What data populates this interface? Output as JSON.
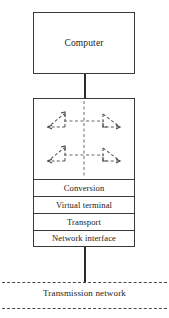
{
  "diagram": {
    "computer": {
      "label": "Computer"
    },
    "stack": {
      "layers": [
        {
          "label": "Conversion"
        },
        {
          "label": "Virtual terminal"
        },
        {
          "label": "Transport"
        },
        {
          "label": "Network interface"
        }
      ],
      "flow_arrows": {
        "description": "Two mirrored pairs of dashed triangular arrows around a dashed vertical axis",
        "rows": 2,
        "per_row": 2
      }
    },
    "network": {
      "label": "Transmission network"
    },
    "colors": {
      "stroke": "#3a3a3a",
      "connector": "#2b2b2b",
      "dashed": "#4a4a4a",
      "background": "#ffffff",
      "text": "#1a1a1a"
    }
  }
}
